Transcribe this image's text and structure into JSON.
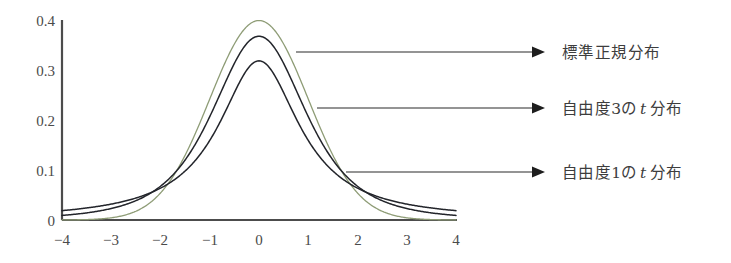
{
  "figure": {
    "background": "#ffffff",
    "axis_color": "#4c4c4c"
  },
  "chart_data": {
    "type": "line",
    "title": "",
    "xlabel": "",
    "ylabel": "",
    "xlim": [
      -4,
      4
    ],
    "ylim": [
      0,
      0.4
    ],
    "grid": false,
    "legend_position": "right-annotations",
    "x_ticks": [
      "−4",
      "−3",
      "−2",
      "−1",
      "0",
      "1",
      "2",
      "3",
      "4"
    ],
    "x_tick_values": [
      -4,
      -3,
      -2,
      -1,
      0,
      1,
      2,
      3,
      4
    ],
    "y_ticks": [
      "0",
      "0.1",
      "0.2",
      "0.3",
      "0.4"
    ],
    "y_tick_values": [
      0,
      0.1,
      0.2,
      0.3,
      0.4
    ],
    "x": [
      -4,
      -3.75,
      -3.5,
      -3.25,
      -3,
      -2.75,
      -2.5,
      -2.25,
      -2,
      -1.75,
      -1.5,
      -1.25,
      -1,
      -0.75,
      -0.5,
      -0.25,
      0,
      0.25,
      0.5,
      0.75,
      1,
      1.25,
      1.5,
      1.75,
      2,
      2.25,
      2.5,
      2.75,
      3,
      3.25,
      3.5,
      3.75,
      4
    ],
    "series": [
      {
        "name": "標準正規分布",
        "color": "#8e9c76",
        "stroke_width": 1.3,
        "peak": 0.3989,
        "values": [
          0.0001,
          0.0004,
          0.0009,
          0.002,
          0.0044,
          0.0091,
          0.0175,
          0.0317,
          0.054,
          0.0863,
          0.1295,
          0.1826,
          0.242,
          0.3011,
          0.3521,
          0.3867,
          0.3989,
          0.3867,
          0.3521,
          0.3011,
          0.242,
          0.1826,
          0.1295,
          0.0863,
          0.054,
          0.0317,
          0.0175,
          0.0091,
          0.0044,
          0.002,
          0.0009,
          0.0004,
          0.0001
        ]
      },
      {
        "name": "自由度3のt分布",
        "color": "#23252b",
        "stroke_width": 1.5,
        "peak": 0.3676,
        "values": [
          0.0092,
          0.0114,
          0.0143,
          0.018,
          0.0229,
          0.0293,
          0.0379,
          0.0495,
          0.0651,
          0.0864,
          0.1153,
          0.1535,
          0.2026,
          0.2621,
          0.3279,
          0.3858,
          0.3676,
          0.3858,
          0.3279,
          0.2621,
          0.2026,
          0.1535,
          0.1153,
          0.0864,
          0.0651,
          0.0495,
          0.0379,
          0.0293,
          0.0229,
          0.018,
          0.0143,
          0.0114,
          0.0092
        ]
      },
      {
        "name": "自由度1のt分布",
        "color": "#23252b",
        "stroke_width": 1.5,
        "peak": 0.3183,
        "values": [
          0.0187,
          0.0211,
          0.024,
          0.0277,
          0.0318,
          0.0371,
          0.0439,
          0.0525,
          0.0637,
          0.0785,
          0.098,
          0.1239,
          0.1592,
          0.2037,
          0.2546,
          0.2995,
          0.3183,
          0.2995,
          0.2546,
          0.2037,
          0.1592,
          0.1239,
          0.098,
          0.0785,
          0.0637,
          0.0525,
          0.0439,
          0.0371,
          0.0318,
          0.0277,
          0.024,
          0.0211,
          0.0187
        ]
      }
    ]
  },
  "annotations": [
    {
      "id": "normal",
      "label": "標準正規分布",
      "label_plain": "標準正規分布",
      "target_curve": "標準正規分布"
    },
    {
      "id": "t3",
      "label_pre": "自由度3の",
      "label_var": "t",
      "label_post": "分布",
      "target_curve": "自由度3のt分布"
    },
    {
      "id": "t1",
      "label_pre": "自由度1の",
      "label_var": "t",
      "label_post": "分布",
      "target_curve": "自由度1のt分布"
    }
  ]
}
